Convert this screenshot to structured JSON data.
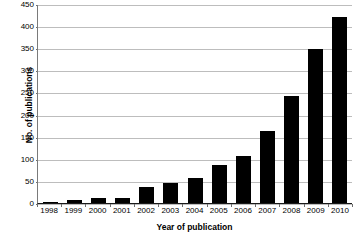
{
  "chart_data": {
    "type": "bar",
    "title": "",
    "xlabel": "Year of publication",
    "ylabel": "No. of publications",
    "categories": [
      "1998",
      "1999",
      "2000",
      "2001",
      "2002",
      "2003",
      "2004",
      "2005",
      "2006",
      "2007",
      "2008",
      "2009",
      "2010"
    ],
    "values": [
      3,
      7,
      12,
      12,
      37,
      46,
      57,
      86,
      106,
      163,
      241,
      349,
      420
    ],
    "series": [
      {
        "name": "No. of publications",
        "values": [
          3,
          7,
          12,
          12,
          37,
          46,
          57,
          86,
          106,
          163,
          241,
          349,
          420
        ]
      }
    ],
    "ylim": [
      0,
      450
    ],
    "yticks": [
      0,
      50,
      100,
      150,
      200,
      250,
      300,
      350,
      400,
      450
    ],
    "ytick_labels": [
      "0",
      "50",
      "100",
      "150",
      "200",
      "250",
      "300",
      "350",
      "400",
      "450"
    ],
    "grid": "horizontal",
    "legend": "none",
    "bar_color": "#000000",
    "grid_color": "#bdbdbd",
    "axis_color": "#1a1a1a",
    "background": "#ffffff"
  },
  "caption": {
    "text": ""
  }
}
